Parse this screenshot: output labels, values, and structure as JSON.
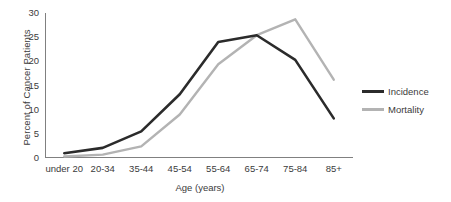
{
  "chart_data": {
    "type": "line",
    "title": "",
    "xlabel": "Age (years)",
    "ylabel": "Percent of Cancer Patients",
    "categories": [
      "under 20",
      "20-34",
      "35-44",
      "45-54",
      "55-64",
      "65-74",
      "75-84",
      "85+"
    ],
    "series": [
      {
        "name": "Incidence",
        "color": "#2b2b2b",
        "values": [
          1.0,
          2.1,
          5.5,
          13.2,
          24.0,
          25.4,
          20.3,
          8.2
        ]
      },
      {
        "name": "Mortality",
        "color": "#b3b3b3",
        "values": [
          0.3,
          0.7,
          2.4,
          9.0,
          19.4,
          25.4,
          28.7,
          16.2
        ]
      }
    ],
    "ylim": [
      0,
      30
    ],
    "yticks": [
      0,
      5,
      10,
      15,
      20,
      25,
      30
    ],
    "ytick_labels": [
      "0",
      "5",
      "10",
      "15",
      "20",
      "25",
      "30"
    ],
    "grid": false,
    "legend_position": "right"
  },
  "axes": {
    "y_title": "Percent of Cancer Patients",
    "x_title": "Age (years)",
    "axis_color": "#808080"
  },
  "legend": {
    "entries": [
      {
        "label": "Incidence",
        "color": "#2b2b2b"
      },
      {
        "label": "Mortality",
        "color": "#b3b3b3"
      }
    ]
  }
}
